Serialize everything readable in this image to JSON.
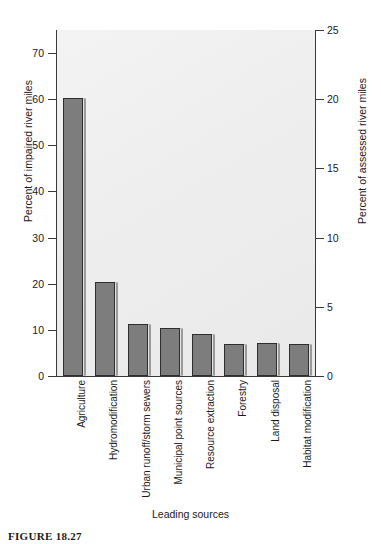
{
  "figure": {
    "caption": "FIGURE 18.27"
  },
  "chart_data": {
    "type": "bar",
    "title": "",
    "xlabel": "Leading sources",
    "ylabel": "Percent of impaired river miles",
    "y2label": "Percent of assessed river miles",
    "categories": [
      "Agriculture",
      "Hydromodification",
      "Urban runoff/storm sewers",
      "Municipal point sources",
      "Resource extraction",
      "Forestry",
      "Land disposal",
      "Habitat modification"
    ],
    "values": [
      60.2,
      20.4,
      11.2,
      10.5,
      9.2,
      7.0,
      7.2,
      7.0
    ],
    "ylim": [
      0,
      75
    ],
    "y2lim": [
      0,
      25
    ],
    "yticks": [
      0,
      10,
      20,
      30,
      40,
      50,
      60,
      70
    ],
    "y2ticks": [
      0,
      5,
      10,
      15,
      20,
      25
    ],
    "grid": false,
    "legend": null,
    "bar_color": "#7d7d7d",
    "bar_edge_color": "#2e2e2e",
    "plot_background": "#eeeeee"
  }
}
